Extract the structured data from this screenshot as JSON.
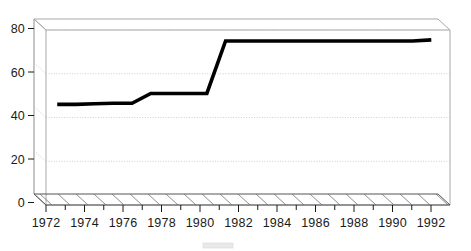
{
  "chart_data": {
    "type": "line",
    "title": "",
    "subtitle": "",
    "xlabel": "",
    "ylabel": "",
    "xlim": [
      1971.4,
      1993.0
    ],
    "ylim": [
      0,
      80
    ],
    "grid": true,
    "grid_axis": "y",
    "legend_position": "bottom",
    "style_3d": true,
    "x_tick_labels": [
      "1972",
      "1974",
      "1976",
      "1978",
      "1980",
      "1982",
      "1984",
      "1986",
      "1988",
      "1990",
      "1992"
    ],
    "x_tick_values": [
      1972,
      1974,
      1976,
      1978,
      1980,
      1982,
      1984,
      1986,
      1988,
      1990,
      1992
    ],
    "x_minor_tick_values": [
      1973,
      1975,
      1977,
      1979,
      1981,
      1983,
      1985,
      1987,
      1989,
      1991
    ],
    "y_tick_labels": [
      "0",
      "20",
      "40",
      "60",
      "80"
    ],
    "y_tick_values": [
      0,
      20,
      40,
      60,
      80
    ],
    "series": [
      {
        "name": "Series 1",
        "color": "#000000",
        "x": [
          1972,
          1973,
          1974,
          1975,
          1976,
          1977,
          1978,
          1979,
          1980,
          1981,
          1982,
          1983,
          1984,
          1985,
          1986,
          1987,
          1988,
          1989,
          1990,
          1991,
          1992
        ],
        "values": [
          46,
          46,
          46.3,
          46.5,
          46.5,
          51,
          51,
          51,
          51,
          75,
          75,
          75,
          75,
          75,
          75,
          75,
          75,
          75,
          75,
          75,
          75.5
        ]
      }
    ],
    "annotations": []
  },
  "legend": {
    "entries": [
      {
        "label": "",
        "swatch_color": "#d6d6d6"
      }
    ]
  },
  "axis_labels": {
    "y": [
      "80",
      "60",
      "40",
      "20",
      "0"
    ],
    "x": [
      "1972",
      "1974",
      "1976",
      "1978",
      "1980",
      "1982",
      "1984",
      "1986",
      "1988",
      "1990",
      "1992"
    ]
  }
}
